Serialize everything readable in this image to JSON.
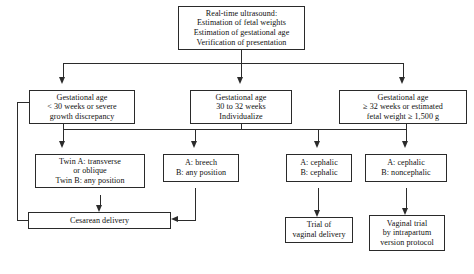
{
  "diagram": {
    "line_color": "#2b2b2b",
    "box_border_color": "#2a2a2a",
    "background": "#ffffff",
    "nodes": {
      "root": {
        "lines": [
          "Real-time ultrasound:",
          "Estimation of fetal weights",
          "Estimation of gestational age",
          "Verification of presentation"
        ]
      },
      "ga_under30": {
        "lines": [
          "Gestational age",
          "< 30 weeks or severe",
          "growth discrepancy"
        ]
      },
      "ga_30to32": {
        "lines": [
          "Gestational age",
          "30 to 32 weeks",
          "Individualize"
        ]
      },
      "ga_32plus": {
        "lines": [
          "Gestational age",
          "≥ 32 weeks or estimated",
          "fetal weight ≥ 1,500 g"
        ]
      },
      "pres_transverse": {
        "lines": [
          "Twin A: transverse",
          "or oblique",
          "Twin B: any position"
        ]
      },
      "pres_breech": {
        "lines": [
          "A: breech",
          "B: any position"
        ]
      },
      "pres_ceph_ceph": {
        "lines": [
          "A: cephalic",
          "B: cephalic"
        ]
      },
      "pres_ceph_noncephalic": {
        "lines": [
          "A: cephalic",
          "B: noncephalic"
        ]
      },
      "cesarean": {
        "lines": [
          "Cesarean delivery"
        ]
      },
      "trial_vaginal": {
        "lines": [
          "Trial of",
          "vaginal delivery"
        ]
      },
      "vaginal_version": {
        "lines": [
          "Vaginal trial",
          "by intrapartum",
          "version protocol"
        ]
      }
    }
  }
}
